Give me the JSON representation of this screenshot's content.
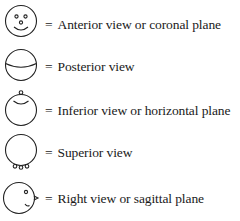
{
  "legend": {
    "equals_sign": "=",
    "items": [
      {
        "icon": "anterior-face-icon",
        "label": "Anterior view or coronal plane"
      },
      {
        "icon": "posterior-head-icon",
        "label": "Posterior view"
      },
      {
        "icon": "inferior-head-icon",
        "label": "Inferior view or horizontal plane"
      },
      {
        "icon": "superior-head-icon",
        "label": "Superior view"
      },
      {
        "icon": "right-profile-head-icon",
        "label": "Right view or sagittal plane"
      }
    ]
  }
}
